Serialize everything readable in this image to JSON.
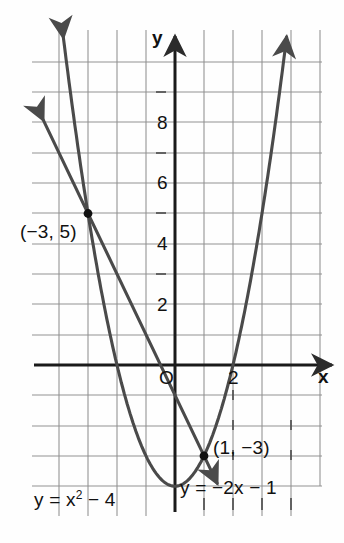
{
  "chart_data": {
    "type": "line",
    "title": "",
    "xlabel": "x",
    "ylabel": "y",
    "xlim": [
      -4.8,
      5.6
    ],
    "ylim": [
      -4.8,
      11.2
    ],
    "grid": true,
    "grid_step": 1,
    "legend_position": "none",
    "axis_origin_label": "O",
    "x_tick_labels": [
      {
        "value": 2,
        "text": "2"
      }
    ],
    "y_tick_labels": [
      {
        "value": 8,
        "text": "8"
      },
      {
        "value": 6,
        "text": "6"
      },
      {
        "value": 4,
        "text": "4"
      },
      {
        "value": 2,
        "text": "2"
      }
    ],
    "series": [
      {
        "name": "parabola",
        "equation_text": "y = x² − 4",
        "equation_main": "y = x",
        "equation_exponent": "2",
        "equation_tail": " − 4",
        "type": "quadratic",
        "a": 1,
        "b": 0,
        "c": -4,
        "vertex": [
          0,
          -4
        ],
        "arrowheads": "both-ends-up"
      },
      {
        "name": "line",
        "equation_text": "y = −2x − 1",
        "type": "linear",
        "slope": -2,
        "intercept": -1,
        "arrowheads": "both-ends"
      }
    ],
    "intersection_points": [
      {
        "x": -3,
        "y": 5,
        "label": "(−3, 5)"
      },
      {
        "x": 1,
        "y": -3,
        "label": "(1, −3)"
      }
    ],
    "annotations": [
      {
        "text": "(−3, 5)",
        "for": "intersection-1"
      },
      {
        "text": "(1, −3)",
        "for": "intersection-2"
      },
      {
        "text": "y = x² − 4",
        "for": "parabola"
      },
      {
        "text": "y = −2x − 1",
        "for": "line"
      }
    ],
    "colors": {
      "curve": "#4a4a4a",
      "axis": "#1a1a1a",
      "grid": "#8c8c8c",
      "background": "#fefefe",
      "point": "#111111"
    }
  },
  "labels": {
    "y_axis": "y",
    "x_axis": "x",
    "origin": "O",
    "x_tick_2": "2",
    "y_tick_8": "8",
    "y_tick_6": "6",
    "y_tick_4": "4",
    "y_tick_2": "2",
    "point_a": "(−3, 5)",
    "point_b": "(1, −3)",
    "eq_parabola_pre": "y = x",
    "eq_parabola_sup": "2",
    "eq_parabola_post": " − 4",
    "eq_line": "y = −2x − 1"
  }
}
